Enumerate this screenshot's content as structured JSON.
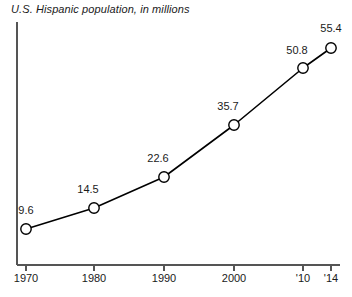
{
  "chart_data": {
    "type": "line",
    "title": "U.S. Hispanic population, in millions",
    "xlabel": "",
    "ylabel": "",
    "categories": [
      "1970",
      "1980",
      "1990",
      "2000",
      "'10",
      "'14"
    ],
    "values": [
      9.6,
      14.5,
      22.6,
      35.7,
      50.8,
      55.4
    ],
    "point_labels": [
      "9.6",
      "14.5",
      "22.6",
      "35.7",
      "50.8",
      "55.4"
    ],
    "tick_labels": [
      "1970",
      "1980",
      "1990",
      "2000",
      "'10",
      "'14"
    ],
    "series": [
      {
        "name": "U.S. Hispanic population",
        "values": [
          9.6,
          14.5,
          22.6,
          35.7,
          50.8,
          55.4
        ]
      }
    ],
    "x": [
      1970,
      1980,
      1990,
      2000,
      2010,
      2014
    ],
    "xlim": [
      1968,
      2015.5
    ],
    "ylim": [
      0,
      62
    ],
    "grid": false,
    "legend": false,
    "marker": "open-circle",
    "line_color": "#000000",
    "marker_fill": "#ffffff",
    "marker_stroke": "#000000",
    "axis_color": "#555555",
    "background": "#ffffff",
    "label_offsets": [
      {
        "dx": -4,
        "dy": -12,
        "align": "left"
      },
      {
        "dx": -10,
        "dy": -11,
        "align": "center"
      },
      {
        "dx": -10,
        "dy": -11,
        "align": "center"
      },
      {
        "dx": -10,
        "dy": -11,
        "align": "center"
      },
      {
        "dx": -10,
        "dy": -11,
        "align": "center"
      },
      {
        "dx": 0,
        "dy": -13,
        "align": "center"
      }
    ]
  },
  "geometry": {
    "axis_x_left": 17,
    "axis_x_right": 340,
    "axis_y_bottom": 265,
    "axis_y_top": 22,
    "points": [
      {
        "x": 26,
        "y": 229
      },
      {
        "x": 94,
        "y": 208
      },
      {
        "x": 164,
        "y": 177
      },
      {
        "x": 234,
        "y": 125
      },
      {
        "x": 303,
        "y": 68
      },
      {
        "x": 331,
        "y": 48
      }
    ],
    "ticks": [
      26,
      94,
      164,
      234,
      303,
      331
    ],
    "label_positions": [
      {
        "x": 26,
        "y": 216
      },
      {
        "x": 88,
        "y": 195
      },
      {
        "x": 158,
        "y": 164
      },
      {
        "x": 228,
        "y": 112
      },
      {
        "x": 297,
        "y": 56
      },
      {
        "x": 331,
        "y": 34
      }
    ],
    "tick_label_y": 272
  }
}
